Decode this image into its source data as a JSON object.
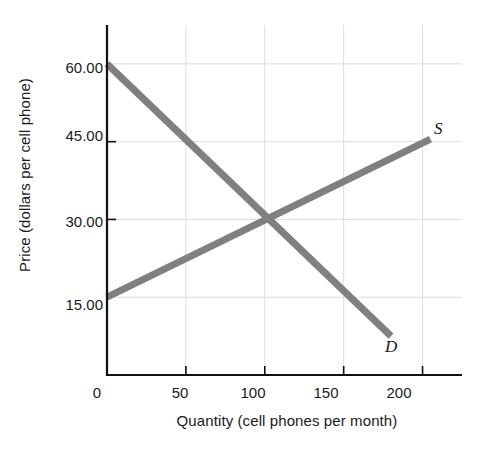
{
  "chart_data": {
    "type": "line",
    "title": "",
    "xlabel": "Quantity (cell phones per month)",
    "ylabel": "Price (dollars per cell phone)",
    "xlim": [
      0,
      225
    ],
    "ylim": [
      0,
      67.5
    ],
    "xticks": [
      "0",
      "50",
      "100",
      "150",
      "200"
    ],
    "xtick_values": [
      0,
      50,
      100,
      150,
      200
    ],
    "yticks": [
      "15.00",
      "30.00",
      "45.00",
      "60.00"
    ],
    "ytick_values": [
      15,
      30,
      45,
      60
    ],
    "grid": true,
    "legend_position": "inline-endpoint-labels",
    "series": [
      {
        "name": "D",
        "label": "D",
        "description": "Demand curve",
        "color": "#808080",
        "x": [
          0,
          100,
          180
        ],
        "y": [
          60.0,
          30.0,
          7.5
        ]
      },
      {
        "name": "S",
        "label": "S",
        "description": "Supply curve",
        "color": "#808080",
        "x": [
          0,
          100,
          205
        ],
        "y": [
          15.0,
          30.0,
          45.5
        ]
      }
    ],
    "annotations": [
      {
        "text": "S",
        "x": 210,
        "y": 48.5
      },
      {
        "text": "D",
        "x": 188,
        "y": 5.5
      }
    ],
    "equilibrium": {
      "quantity": 100,
      "price": 30.0
    }
  },
  "colors": {
    "curve": "#808080",
    "axis": "#111111",
    "grid": "#d8d8d8",
    "background": "#ffffff",
    "text": "#1a1a1a"
  },
  "axes": {
    "x_title": "Quantity (cell phones per month)",
    "y_title": "Price (dollars per cell phone)"
  },
  "ticks": {
    "y": [
      {
        "label": "60.00",
        "value": 60
      },
      {
        "label": "45.00",
        "value": 45
      },
      {
        "label": "30.00",
        "value": 30
      },
      {
        "label": "15.00",
        "value": 15
      }
    ],
    "x": [
      {
        "label": "0",
        "value": 0
      },
      {
        "label": "50",
        "value": 50
      },
      {
        "label": "100",
        "value": 100
      },
      {
        "label": "150",
        "value": 150
      },
      {
        "label": "200",
        "value": 200
      }
    ]
  },
  "curve_labels": {
    "supply": "S",
    "demand": "D"
  }
}
